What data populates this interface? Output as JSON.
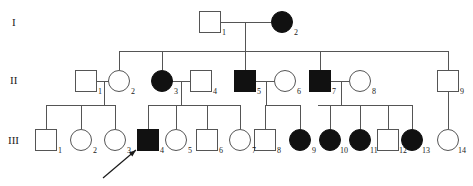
{
  "figure": {
    "type": "pedigree-chart",
    "width": 473,
    "height": 186,
    "background_color": "#ffffff",
    "line_color": "#555555",
    "affected_fill_color": "#111111",
    "unaffected_fill_color": "#ffffff"
  },
  "generation_labels": [
    {
      "text": "I",
      "x": 12,
      "y": 26
    },
    {
      "text": "II",
      "x": 10,
      "y": 84
    },
    {
      "text": "III",
      "x": 8,
      "y": 144
    }
  ],
  "legend_semantics": {
    "square": "male",
    "circle": "female",
    "filled": "affected",
    "open": "unaffected",
    "arrow": "proband"
  },
  "individuals": [
    {
      "id": "I-1",
      "label": "1",
      "generation": "I",
      "sex": "male",
      "affected": false,
      "cx": 210,
      "cy": 22,
      "label_x": 222,
      "label_y": 35
    },
    {
      "id": "I-2",
      "label": "2",
      "generation": "I",
      "sex": "female",
      "affected": true,
      "cx": 282,
      "cy": 22,
      "label_x": 294,
      "label_y": 35
    },
    {
      "id": "II-1",
      "label": "1",
      "generation": "II",
      "sex": "male",
      "affected": false,
      "cx": 86,
      "cy": 81,
      "label_x": 98,
      "label_y": 94
    },
    {
      "id": "II-2",
      "label": "2",
      "generation": "II",
      "sex": "female",
      "affected": false,
      "cx": 119,
      "cy": 81,
      "label_x": 131,
      "label_y": 94
    },
    {
      "id": "II-3",
      "label": "3",
      "generation": "II",
      "sex": "female",
      "affected": true,
      "cx": 162,
      "cy": 81,
      "label_x": 174,
      "label_y": 94
    },
    {
      "id": "II-4",
      "label": "4",
      "generation": "II",
      "sex": "male",
      "affected": false,
      "cx": 201,
      "cy": 81,
      "label_x": 213,
      "label_y": 94
    },
    {
      "id": "II-5",
      "label": "5",
      "generation": "II",
      "sex": "male",
      "affected": true,
      "cx": 245,
      "cy": 81,
      "label_x": 257,
      "label_y": 94
    },
    {
      "id": "II-6",
      "label": "6",
      "generation": "II",
      "sex": "female",
      "affected": false,
      "cx": 285,
      "cy": 81,
      "label_x": 297,
      "label_y": 94
    },
    {
      "id": "II-7",
      "label": "7",
      "generation": "II",
      "sex": "male",
      "affected": true,
      "cx": 320,
      "cy": 81,
      "label_x": 332,
      "label_y": 94
    },
    {
      "id": "II-8",
      "label": "8",
      "generation": "II",
      "sex": "female",
      "affected": false,
      "cx": 360,
      "cy": 81,
      "label_x": 372,
      "label_y": 94
    },
    {
      "id": "II-9",
      "label": "9",
      "generation": "II",
      "sex": "male",
      "affected": false,
      "cx": 448,
      "cy": 81,
      "label_x": 460,
      "label_y": 94
    },
    {
      "id": "III-1",
      "label": "1",
      "generation": "III",
      "sex": "male",
      "affected": false,
      "cx": 46,
      "cy": 140,
      "label_x": 58,
      "label_y": 153
    },
    {
      "id": "III-2",
      "label": "2",
      "generation": "III",
      "sex": "female",
      "affected": false,
      "cx": 81,
      "cy": 140,
      "label_x": 93,
      "label_y": 153
    },
    {
      "id": "III-3",
      "label": "3",
      "generation": "III",
      "sex": "female",
      "affected": false,
      "cx": 115,
      "cy": 140,
      "label_x": 127,
      "label_y": 153
    },
    {
      "id": "III-4",
      "label": "4",
      "generation": "III",
      "sex": "male",
      "affected": true,
      "cx": 148,
      "cy": 140,
      "label_x": 160,
      "label_y": 153
    },
    {
      "id": "III-5",
      "label": "5",
      "generation": "III",
      "sex": "female",
      "affected": false,
      "cx": 176,
      "cy": 140,
      "label_x": 188,
      "label_y": 153
    },
    {
      "id": "III-6",
      "label": "6",
      "generation": "III",
      "sex": "male",
      "affected": false,
      "cx": 207,
      "cy": 140,
      "label_x": 219,
      "label_y": 153
    },
    {
      "id": "III-7",
      "label": "7",
      "generation": "III",
      "sex": "female",
      "affected": false,
      "cx": 240,
      "cy": 140,
      "label_x": 252,
      "label_y": 153
    },
    {
      "id": "III-8",
      "label": "8",
      "generation": "III",
      "sex": "male",
      "affected": false,
      "cx": 265,
      "cy": 140,
      "label_x": 277,
      "label_y": 153
    },
    {
      "id": "III-9",
      "label": "9",
      "generation": "III",
      "sex": "female",
      "affected": true,
      "cx": 300,
      "cy": 140,
      "label_x": 312,
      "label_y": 153
    },
    {
      "id": "III-10",
      "label": "10",
      "generation": "III",
      "sex": "female",
      "affected": true,
      "cx": 330,
      "cy": 140,
      "label_x": 340,
      "label_y": 153
    },
    {
      "id": "III-11",
      "label": "11",
      "generation": "III",
      "sex": "female",
      "affected": true,
      "cx": 360,
      "cy": 140,
      "label_x": 370,
      "label_y": 153
    },
    {
      "id": "III-12",
      "label": "12",
      "generation": "III",
      "sex": "male",
      "affected": false,
      "cx": 388,
      "cy": 140,
      "label_x": 399,
      "label_y": 153
    },
    {
      "id": "III-13",
      "label": "13",
      "generation": "III",
      "sex": "female",
      "affected": true,
      "cx": 412,
      "cy": 140,
      "label_x": 422,
      "label_y": 153
    },
    {
      "id": "III-14",
      "label": "14",
      "generation": "III",
      "sex": "female",
      "affected": false,
      "cx": 448,
      "cy": 140,
      "label_x": 458,
      "label_y": 153
    }
  ],
  "connections": {
    "mating_lines": [
      {
        "name": "I-1_x_I-2",
        "x1": 221,
        "y1": 22,
        "x2": 271,
        "y2": 22
      },
      {
        "name": "II-1_x_II-2",
        "x1": 97,
        "y1": 81,
        "x2": 110,
        "y2": 81
      },
      {
        "name": "II-3_x_II-4",
        "x1": 171,
        "y1": 81,
        "x2": 190,
        "y2": 81
      },
      {
        "name": "II-5_x_II-6",
        "x1": 256,
        "y1": 81,
        "x2": 276,
        "y2": 81
      },
      {
        "name": "II-7_x_II-8",
        "x1": 331,
        "y1": 81,
        "x2": 351,
        "y2": 81
      }
    ],
    "descent_drops": [
      {
        "name": "I-couple-drop",
        "x1": 245,
        "y1": 22,
        "x2": 245,
        "y2": 51
      },
      {
        "name": "II-1-couple-drop",
        "x1": 104,
        "y1": 81,
        "x2": 104,
        "y2": 105
      },
      {
        "name": "II-3-couple-drop",
        "x1": 181,
        "y1": 81,
        "x2": 181,
        "y2": 105
      },
      {
        "name": "II-5-couple-drop",
        "x1": 266,
        "y1": 81,
        "x2": 266,
        "y2": 105
      },
      {
        "name": "II-7-couple-drop",
        "x1": 341,
        "y1": 81,
        "x2": 341,
        "y2": 105
      },
      {
        "name": "II-9-drop",
        "x1": 448,
        "y1": 92,
        "x2": 448,
        "y2": 129
      }
    ],
    "sibship_bars": [
      {
        "name": "gen2-sibship-bar",
        "x1": 119,
        "y": 51,
        "x2": 448
      },
      {
        "name": "gen3-sibship-bar-a",
        "x1": 46,
        "y": 105,
        "x2": 115
      },
      {
        "name": "gen3-sibship-bar-b",
        "x1": 148,
        "y": 105,
        "x2": 240
      },
      {
        "name": "gen3-sibship-bar-c",
        "x1": 265,
        "y": 105,
        "x2": 300
      },
      {
        "name": "gen3-sibship-bar-d",
        "x1": 318,
        "y": 105,
        "x2": 412
      }
    ],
    "child_stems_gen2": [
      {
        "name": "stem-II-2",
        "x": 119,
        "y1": 51,
        "y2": 70
      },
      {
        "name": "stem-II-3",
        "x": 162,
        "y1": 51,
        "y2": 70
      },
      {
        "name": "stem-II-5",
        "x": 245,
        "y1": 51,
        "y2": 70
      },
      {
        "name": "stem-II-7",
        "x": 320,
        "y1": 51,
        "y2": 70
      },
      {
        "name": "stem-II-9",
        "x": 448,
        "y1": 51,
        "y2": 70
      }
    ],
    "child_stems_gen3": [
      {
        "name": "stem-III-1",
        "x": 46,
        "y1": 105,
        "y2": 129
      },
      {
        "name": "stem-III-2",
        "x": 81,
        "y1": 105,
        "y2": 129
      },
      {
        "name": "stem-III-3",
        "x": 115,
        "y1": 105,
        "y2": 129
      },
      {
        "name": "stem-III-4",
        "x": 148,
        "y1": 105,
        "y2": 129
      },
      {
        "name": "stem-III-5",
        "x": 176,
        "y1": 105,
        "y2": 129
      },
      {
        "name": "stem-III-6",
        "x": 207,
        "y1": 105,
        "y2": 129
      },
      {
        "name": "stem-III-7",
        "x": 240,
        "y1": 105,
        "y2": 129
      },
      {
        "name": "stem-III-8",
        "x": 265,
        "y1": 105,
        "y2": 129
      },
      {
        "name": "stem-III-9",
        "x": 300,
        "y1": 105,
        "y2": 129
      },
      {
        "name": "stem-III-10",
        "x": 330,
        "y1": 105,
        "y2": 129
      },
      {
        "name": "stem-III-11",
        "x": 360,
        "y1": 105,
        "y2": 129
      },
      {
        "name": "stem-III-12",
        "x": 388,
        "y1": 105,
        "y2": 129
      },
      {
        "name": "stem-III-13",
        "x": 412,
        "y1": 105,
        "y2": 129
      }
    ]
  },
  "proband_arrow": {
    "target": "III-4",
    "x1": 103,
    "y1": 178,
    "x2": 136,
    "y2": 150
  },
  "symbol_size": {
    "square_side": 21,
    "circle_radius": 10.5
  }
}
